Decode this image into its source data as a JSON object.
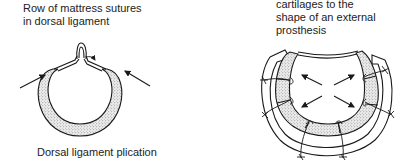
{
  "figure": {
    "left_panel": {
      "annotation_lines": [
        "Row of mattress sutures",
        "in dorsal ligament"
      ],
      "caption": "Dorsal ligament plication",
      "arrow_count": 2,
      "icons": [
        "suture-loop-icon",
        "inward-arrow-icon"
      ]
    },
    "right_panel": {
      "annotation_lines": [
        "cartilages to the",
        "shape of an external",
        "prosthesis"
      ],
      "arrow_count": 4,
      "suture_count": 6,
      "icons": [
        "outward-arrow-icon",
        "suture-knot-icon",
        "external-prosthesis-ring"
      ]
    },
    "colors": {
      "ink": "#1a1a1a",
      "cartilage_fill": "#d9d9d9",
      "background": "#ffffff"
    }
  }
}
